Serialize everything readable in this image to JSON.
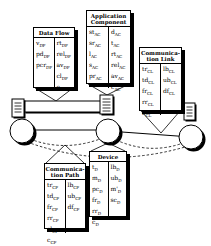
{
  "figure": {
    "bg_color": "#ffffff",
    "ink_color": "#000000",
    "boxes": [
      {
        "id": "data-flow",
        "title_lines": [
          "Data Flow"
        ],
        "left": [
          {
            "t": "v",
            "s": "DF"
          },
          {
            "t": "pd",
            "s": "DF"
          },
          {
            "t": "pcr",
            "s": "DF"
          }
        ],
        "right": [
          {
            "t": "rt",
            "s": "DF"
          },
          {
            "t": "rel",
            "s": "DF"
          },
          {
            "t": "av",
            "s": "DF"
          },
          {
            "t": "cl",
            "s": "DF"
          },
          {
            "t": "c",
            "s": "DF"
          }
        ]
      },
      {
        "id": "application-component",
        "title_lines": [
          "Application",
          "Component"
        ],
        "left": [
          {
            "t": "st",
            "s": "AC"
          },
          {
            "t": "sr",
            "s": "AC"
          },
          {
            "t": "l",
            "s": "AC"
          },
          {
            "t": "s",
            "s": "AC"
          },
          {
            "t": "pr",
            "s": "AC"
          }
        ],
        "right": [
          {
            "t": "d",
            "s": "AC"
          },
          {
            "t": "t",
            "s": "AC"
          },
          {
            "t": "rt",
            "s": "AC"
          },
          {
            "t": "rel",
            "s": "AC"
          },
          {
            "t": "av",
            "s": "AC"
          },
          {
            "t": "c",
            "s": "AC"
          }
        ]
      },
      {
        "id": "communication-link",
        "title_lines": [
          "Communica-",
          "tion Link"
        ],
        "left": [
          {
            "t": "tr",
            "s": "CL"
          },
          {
            "t": "td",
            "s": "CL"
          },
          {
            "t": "fr",
            "s": "CL"
          },
          {
            "t": "rr",
            "s": "CL"
          },
          {
            "t": "c",
            "s": "CL"
          }
        ],
        "right": [
          {
            "t": "lb",
            "s": "CL"
          },
          {
            "t": "ub",
            "s": "CL"
          },
          {
            "t": "df",
            "s": "CL"
          }
        ]
      },
      {
        "id": "communication-path",
        "title_lines": [
          "Communica-",
          "tion Path"
        ],
        "left": [
          {
            "t": "tr",
            "s": "CP"
          },
          {
            "t": "td",
            "s": "CP"
          },
          {
            "t": "fr",
            "s": "CP"
          },
          {
            "t": "rr",
            "s": "CP"
          },
          {
            "t": "cl",
            "s": "CP"
          },
          {
            "t": "c",
            "s": "CP"
          }
        ],
        "right": [
          {
            "t": "lb",
            "s": "CP"
          },
          {
            "t": "ub",
            "s": "CP"
          },
          {
            "t": "df",
            "s": "CP"
          }
        ]
      },
      {
        "id": "device",
        "title_lines": [
          "Device"
        ],
        "left": [
          {
            "t": "t",
            "s": "D"
          },
          {
            "t": "m",
            "s": "D"
          },
          {
            "t": "pc",
            "s": "D"
          },
          {
            "t": "fr",
            "s": "D"
          },
          {
            "t": "rr",
            "s": "D"
          },
          {
            "t": "c",
            "s": "D"
          }
        ],
        "right": [
          {
            "t": "lb",
            "s": "D"
          },
          {
            "t": "ub",
            "s": "D"
          },
          {
            "t": "m'",
            "s": "D"
          },
          {
            "t": "sc",
            "s": "D"
          }
        ]
      }
    ],
    "icons": [
      "host-icon",
      "network-node-icon",
      "communication-link-bar",
      "callout-funnel",
      "dashed-path"
    ]
  }
}
